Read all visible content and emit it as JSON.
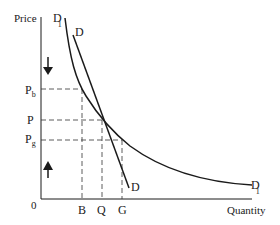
{
  "diagram": {
    "title": "",
    "y_axis_label": "Price",
    "x_axis_label": "Quantity",
    "origin_label": "0",
    "price_labels": {
      "pb": {
        "main": "P",
        "sub": "b"
      },
      "p": {
        "main": "P",
        "sub": ""
      },
      "pg": {
        "main": "P",
        "sub": "g"
      }
    },
    "quantity_labels": {
      "b": "B",
      "q": "Q",
      "g": "G"
    },
    "curves": {
      "d1": {
        "main": "D",
        "sub": "1",
        "shape": "convex curve (more elastic)"
      },
      "d": {
        "main": "D",
        "sub": "",
        "shape": "straight line (steeper)"
      }
    },
    "arrows": {
      "upper": "down-arrow",
      "lower": "up-arrow"
    },
    "colors": {
      "line": "#1a1a1a",
      "dashed": "#333333",
      "background": "#ffffff"
    }
  }
}
